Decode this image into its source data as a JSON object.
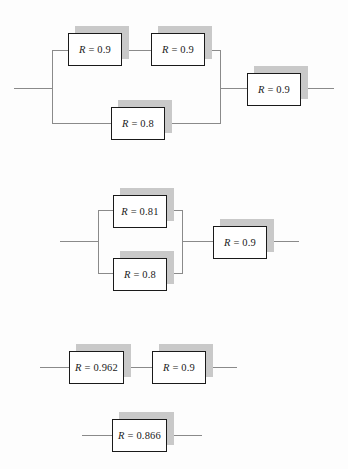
{
  "figure": {
    "type": "reliability-block-diagram",
    "background_color": "#fdfdfd",
    "block_border_color": "#1a1a1a",
    "block_fill_color": "#ffffff",
    "shadow_color": "#c9c9c9",
    "wire_color": "#8a8a8a"
  },
  "stages": [
    {
      "id": "stage-1",
      "name": "original-network",
      "blocks": [
        {
          "id": "s1-b1",
          "label": "R = 0.9",
          "symbol": "R",
          "operator": "=",
          "value": "0.9",
          "branch": "upper",
          "position": 1
        },
        {
          "id": "s1-b2",
          "label": "R = 0.9",
          "symbol": "R",
          "operator": "=",
          "value": "0.9",
          "branch": "upper",
          "position": 2
        },
        {
          "id": "s1-b3",
          "label": "R = 0.8",
          "symbol": "R",
          "operator": "=",
          "value": "0.8",
          "branch": "lower",
          "position": 1
        },
        {
          "id": "s1-b4",
          "label": "R = 0.9",
          "symbol": "R",
          "operator": "=",
          "value": "0.9",
          "branch": "series",
          "position": 1
        }
      ]
    },
    {
      "id": "stage-2",
      "name": "first-reduction",
      "blocks": [
        {
          "id": "s2-b1",
          "label": "R = 0.81",
          "symbol": "R",
          "operator": "=",
          "value": "0.81",
          "branch": "upper",
          "position": 1
        },
        {
          "id": "s2-b2",
          "label": "R = 0.8",
          "symbol": "R",
          "operator": "=",
          "value": "0.8",
          "branch": "lower",
          "position": 1
        },
        {
          "id": "s2-b3",
          "label": "R = 0.9",
          "symbol": "R",
          "operator": "=",
          "value": "0.9",
          "branch": "series",
          "position": 1
        }
      ]
    },
    {
      "id": "stage-3",
      "name": "second-reduction",
      "blocks": [
        {
          "id": "s3-b1",
          "label": "R = 0.962",
          "symbol": "R",
          "operator": "=",
          "value": "0.962",
          "branch": "series",
          "position": 1
        },
        {
          "id": "s3-b2",
          "label": "R = 0.9",
          "symbol": "R",
          "operator": "=",
          "value": "0.9",
          "branch": "series",
          "position": 2
        }
      ]
    },
    {
      "id": "stage-4",
      "name": "final-reduction",
      "blocks": [
        {
          "id": "s4-b1",
          "label": "R = 0.866",
          "symbol": "R",
          "operator": "=",
          "value": "0.866",
          "branch": "series",
          "position": 1
        }
      ]
    }
  ]
}
